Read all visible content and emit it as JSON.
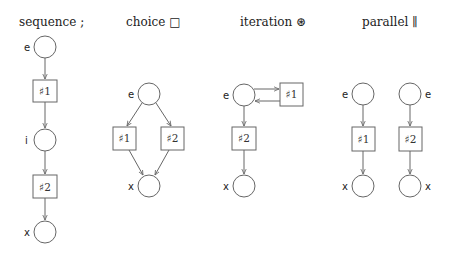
{
  "colors": {
    "stroke": "#666666",
    "text": "#222222",
    "background": "#ffffff"
  },
  "panels": [
    {
      "id": "sequence",
      "title": "sequence ;",
      "places": [
        {
          "label": "e",
          "cx": 45,
          "cy": 47
        },
        {
          "label": "i",
          "cx": 45,
          "cy": 140
        },
        {
          "label": "x",
          "cx": 45,
          "cy": 232
        }
      ],
      "transitions": [
        {
          "label": "♯1",
          "x": 33,
          "y": 80
        },
        {
          "label": "♯2",
          "x": 33,
          "y": 175
        }
      ]
    },
    {
      "id": "choice",
      "title": "choice □",
      "places": [
        {
          "label": "e",
          "cx": 149,
          "cy": 94
        },
        {
          "label": "x",
          "cx": 149,
          "cy": 186
        }
      ],
      "transitions": [
        {
          "label": "♯1",
          "x": 113,
          "y": 127
        },
        {
          "label": "♯2",
          "x": 161,
          "y": 127
        }
      ]
    },
    {
      "id": "iteration",
      "title": "iteration ⊛",
      "places": [
        {
          "label": "e",
          "cx": 244,
          "cy": 95
        },
        {
          "label": "x",
          "cx": 244,
          "cy": 186
        }
      ],
      "transitions": [
        {
          "label": "♯1",
          "x": 280,
          "y": 83
        },
        {
          "label": "♯2",
          "x": 232,
          "y": 127
        }
      ]
    },
    {
      "id": "parallel",
      "title": "parallel ∥",
      "places": [
        {
          "label": "e",
          "cx": 363,
          "cy": 94
        },
        {
          "label": "x",
          "cx": 363,
          "cy": 186
        },
        {
          "label": "e",
          "cx": 410,
          "cy": 94
        },
        {
          "label": "x",
          "cx": 410,
          "cy": 186
        }
      ],
      "transitions": [
        {
          "label": "♯1",
          "x": 352,
          "y": 127
        },
        {
          "label": "♯2",
          "x": 399,
          "y": 127
        }
      ]
    }
  ]
}
